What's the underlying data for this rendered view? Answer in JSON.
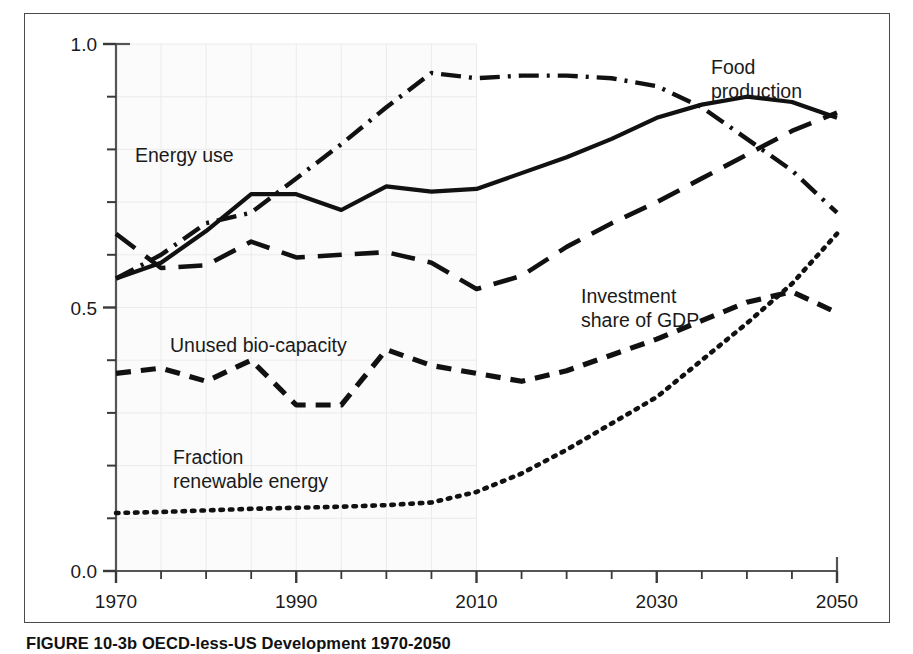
{
  "figure": {
    "caption": "FIGURE 10-3b  OECD-less-US Development 1970-2050"
  },
  "chart_data": {
    "type": "line",
    "title": "",
    "subtitle": "",
    "xlabel": "",
    "ylabel": "",
    "xlim": [
      1970,
      2050
    ],
    "ylim": [
      0.0,
      1.0
    ],
    "grid": true,
    "grid_region": [
      1970,
      2010
    ],
    "legend_position": "inline-annotations",
    "x_tick_labels": [
      "1970",
      "1990",
      "2010",
      "2030",
      "2050"
    ],
    "x_tick_values": [
      1970,
      1990,
      2010,
      2030,
      2050
    ],
    "x_minor_tick_step": 5,
    "y_tick_labels": [
      "0.0",
      "0.5",
      "1.0"
    ],
    "y_tick_values": [
      0.0,
      0.5,
      1.0
    ],
    "y_minor_tick_step": 0.1,
    "x": [
      1970,
      1975,
      1980,
      1985,
      1990,
      1995,
      2000,
      2005,
      2010,
      2015,
      2020,
      2025,
      2030,
      2035,
      2040,
      2045,
      2050
    ],
    "series": [
      {
        "name": "Food production",
        "label": "Food production",
        "style": "solid",
        "color": "#111111",
        "values": [
          0.555,
          0.585,
          0.645,
          0.715,
          0.715,
          0.685,
          0.73,
          0.72,
          0.725,
          0.755,
          0.785,
          0.82,
          0.86,
          0.885,
          0.9,
          0.89,
          0.86
        ]
      },
      {
        "name": "Energy use",
        "label": "Energy use",
        "style": "dash-dot",
        "color": "#111111",
        "values": [
          0.555,
          0.6,
          0.66,
          0.68,
          0.745,
          0.81,
          0.88,
          0.945,
          0.935,
          0.94,
          0.94,
          0.935,
          0.92,
          0.88,
          0.82,
          0.76,
          0.68
        ]
      },
      {
        "name": "Investment share of GDP",
        "label": "Investment share of GDP",
        "style": "long-dash",
        "color": "#111111",
        "values": [
          0.64,
          0.575,
          0.58,
          0.625,
          0.595,
          0.6,
          0.605,
          0.585,
          0.535,
          0.56,
          0.615,
          0.66,
          0.7,
          0.745,
          0.79,
          0.835,
          0.87
        ]
      },
      {
        "name": "Unused bio-capacity",
        "label": "Unused bio-capacity",
        "style": "medium-dash",
        "color": "#111111",
        "values": [
          0.375,
          0.385,
          0.36,
          0.4,
          0.315,
          0.315,
          0.42,
          0.39,
          0.375,
          0.36,
          0.38,
          0.41,
          0.44,
          0.475,
          0.51,
          0.53,
          0.49
        ]
      },
      {
        "name": "Fraction renewable energy",
        "label": "Fraction renewable energy",
        "style": "dotted",
        "color": "#111111",
        "values": [
          0.11,
          0.112,
          0.115,
          0.118,
          0.12,
          0.122,
          0.125,
          0.13,
          0.15,
          0.185,
          0.23,
          0.28,
          0.33,
          0.4,
          0.47,
          0.545,
          0.64
        ]
      }
    ],
    "annotations": [
      {
        "name": "energy-use",
        "text": "Energy use",
        "line1": "Energy use",
        "line2": ""
      },
      {
        "name": "food-production",
        "text": "Food production",
        "line1": "Food",
        "line2": "production"
      },
      {
        "name": "investment-share",
        "text": "Investment share of GDP",
        "line1": "Investment",
        "line2": "share of GDP"
      },
      {
        "name": "unused-bio-capacity",
        "text": "Unused bio-capacity",
        "line1": "Unused bio-capacity",
        "line2": ""
      },
      {
        "name": "fraction-renewable-energy",
        "text": "Fraction renewable energy",
        "line1": "Fraction",
        "line2": "renewable energy"
      }
    ]
  }
}
